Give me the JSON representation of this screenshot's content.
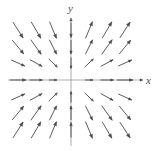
{
  "figure": {
    "kind": "direction-field",
    "width": 161,
    "height": 151,
    "background": "#ffffff",
    "stroke_color": "#4a4a4a",
    "axis_color": "#8c8c8c"
  },
  "labels": {
    "y_axis": "y",
    "x_axis": "x"
  },
  "axes": {
    "origin_px": [
      71,
      80
    ],
    "x_axis_y_px": 80,
    "y_axis_x_px": 71,
    "x_axis_start_px": 8,
    "x_axis_end_px": 143,
    "y_axis_start_px": 18,
    "y_axis_end_px": 146,
    "x_tick_values": [
      -3,
      -2,
      -1,
      0,
      1,
      2,
      3
    ],
    "y_tick_values": [
      3,
      2,
      1,
      0,
      -1,
      -2,
      -3
    ],
    "grid": false
  },
  "chart_data": {
    "type": "scatter",
    "title": "",
    "xlabel": "x",
    "ylabel": "y",
    "xlim": [
      -3.5,
      3.5
    ],
    "ylim": [
      -3.5,
      3.5
    ],
    "grid": false,
    "legend": null,
    "columns_x": [
      -3,
      -2,
      -1,
      0,
      1,
      2,
      3
    ],
    "rows_y": [
      3,
      2,
      1,
      0,
      -1,
      -2,
      -3
    ],
    "columns_px": [
      18,
      36,
      53,
      71,
      89,
      107,
      125
    ],
    "rows_px": [
      30,
      47,
      63,
      80,
      97,
      113,
      130
    ],
    "vectors": [
      {
        "x": -3,
        "y": 3,
        "u": 1.0,
        "v": -1.55,
        "len": 19
      },
      {
        "x": -2,
        "y": 3,
        "u": 1.0,
        "v": -1.7,
        "len": 19
      },
      {
        "x": -1,
        "y": 3,
        "u": 1.0,
        "v": -2.4,
        "len": 18
      },
      {
        "x": 0,
        "y": 3,
        "u": 0.0,
        "v": -1.0,
        "len": 15
      },
      {
        "x": 1,
        "y": 3,
        "u": 1.0,
        "v": 2.4,
        "len": 18
      },
      {
        "x": 2,
        "y": 3,
        "u": 1.0,
        "v": 1.7,
        "len": 19
      },
      {
        "x": 3,
        "y": 3,
        "u": 1.0,
        "v": 1.55,
        "len": 19
      },
      {
        "x": -3,
        "y": 2,
        "u": 1.0,
        "v": -1.2,
        "len": 18
      },
      {
        "x": -2,
        "y": 2,
        "u": 1.0,
        "v": -1.4,
        "len": 18
      },
      {
        "x": -1,
        "y": 2,
        "u": 1.0,
        "v": -2.0,
        "len": 16
      },
      {
        "x": 0,
        "y": 2,
        "u": 0.0,
        "v": -1.0,
        "len": 14
      },
      {
        "x": 1,
        "y": 2,
        "u": 1.0,
        "v": 2.0,
        "len": 16
      },
      {
        "x": 2,
        "y": 2,
        "u": 1.0,
        "v": 1.4,
        "len": 18
      },
      {
        "x": 3,
        "y": 2,
        "u": 1.0,
        "v": 1.2,
        "len": 18
      },
      {
        "x": -3,
        "y": 1,
        "u": 1.0,
        "v": -0.45,
        "len": 15
      },
      {
        "x": -2,
        "y": 1,
        "u": 1.0,
        "v": -0.55,
        "len": 14
      },
      {
        "x": -1,
        "y": 1,
        "u": 1.0,
        "v": -0.95,
        "len": 12
      },
      {
        "x": 0,
        "y": 1,
        "u": 0.0,
        "v": -1.0,
        "len": 11
      },
      {
        "x": 1,
        "y": 1,
        "u": 1.0,
        "v": 0.95,
        "len": 12
      },
      {
        "x": 2,
        "y": 1,
        "u": 1.0,
        "v": 0.55,
        "len": 14
      },
      {
        "x": 3,
        "y": 1,
        "u": 1.0,
        "v": 0.45,
        "len": 15
      },
      {
        "x": -3,
        "y": 0,
        "u": 1.0,
        "v": 0.0,
        "len": 16
      },
      {
        "x": -2,
        "y": 0,
        "u": 1.0,
        "v": 0.0,
        "len": 13
      },
      {
        "x": -1,
        "y": 0,
        "u": 1.0,
        "v": 0.0,
        "len": 8
      },
      {
        "x": 0,
        "y": 0,
        "u": 0.0,
        "v": 0.0,
        "len": 0
      },
      {
        "x": 1,
        "y": 0,
        "u": 1.0,
        "v": 0.0,
        "len": 8
      },
      {
        "x": 2,
        "y": 0,
        "u": 1.0,
        "v": 0.0,
        "len": 13
      },
      {
        "x": 3,
        "y": 0,
        "u": 1.0,
        "v": 0.0,
        "len": 16
      },
      {
        "x": -3,
        "y": -1,
        "u": 1.0,
        "v": 0.45,
        "len": 15
      },
      {
        "x": -2,
        "y": -1,
        "u": 1.0,
        "v": 0.55,
        "len": 14
      },
      {
        "x": -1,
        "y": -1,
        "u": 1.0,
        "v": 0.95,
        "len": 12
      },
      {
        "x": 0,
        "y": -1,
        "u": 0.0,
        "v": 1.0,
        "len": 11
      },
      {
        "x": 1,
        "y": -1,
        "u": 1.0,
        "v": -0.95,
        "len": 12
      },
      {
        "x": 2,
        "y": -1,
        "u": 1.0,
        "v": -0.55,
        "len": 14
      },
      {
        "x": 3,
        "y": -1,
        "u": 1.0,
        "v": -0.45,
        "len": 15
      },
      {
        "x": -3,
        "y": -2,
        "u": 1.0,
        "v": 1.2,
        "len": 18
      },
      {
        "x": -2,
        "y": -2,
        "u": 1.0,
        "v": 1.4,
        "len": 18
      },
      {
        "x": -1,
        "y": -2,
        "u": 1.0,
        "v": 2.0,
        "len": 16
      },
      {
        "x": 0,
        "y": -2,
        "u": 0.0,
        "v": 1.0,
        "len": 14
      },
      {
        "x": 1,
        "y": -2,
        "u": 1.0,
        "v": -2.0,
        "len": 16
      },
      {
        "x": 2,
        "y": -2,
        "u": 1.0,
        "v": -1.4,
        "len": 18
      },
      {
        "x": 3,
        "y": -2,
        "u": 1.0,
        "v": -1.2,
        "len": 18
      },
      {
        "x": -3,
        "y": -3,
        "u": 1.0,
        "v": 1.55,
        "len": 19
      },
      {
        "x": -2,
        "y": -3,
        "u": 1.0,
        "v": 1.7,
        "len": 19
      },
      {
        "x": -1,
        "y": -3,
        "u": 1.0,
        "v": 2.4,
        "len": 18
      },
      {
        "x": 0,
        "y": -3,
        "u": 0.0,
        "v": 1.0,
        "len": 15
      },
      {
        "x": 1,
        "y": -3,
        "u": 1.0,
        "v": -2.4,
        "len": 18
      },
      {
        "x": 2,
        "y": -3,
        "u": 1.0,
        "v": -1.7,
        "len": 19
      },
      {
        "x": 3,
        "y": -3,
        "u": 1.0,
        "v": -1.55,
        "len": 19
      }
    ]
  }
}
